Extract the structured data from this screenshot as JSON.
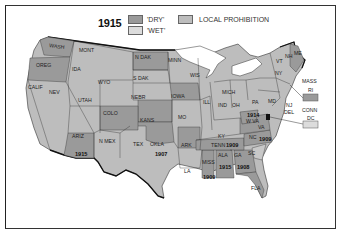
{
  "title": "1915",
  "legend": {
    "dry": {
      "label": "'DRY'",
      "color": "#9a9a9a"
    },
    "wet": {
      "label": "'WET'",
      "color": "#dcdcdc"
    },
    "local": {
      "label": "LOCAL PROHIBITION",
      "color": "#bdbdbd"
    }
  },
  "states": {
    "wash": "WASH",
    "oreg": "OREG",
    "calif": "CALIF",
    "ida": "IDA",
    "nev": "NEV",
    "mont": "MONT",
    "wyo": "WYO",
    "utah": "UTAH",
    "ariz": "ARIZ",
    "colo": "COLO",
    "nmex": "N MEX",
    "ndak": "N DAK",
    "sdak": "S DAK",
    "nebr": "NEBR",
    "kans": "KANS",
    "okla": "OKLA",
    "tex": "TEX",
    "minn": "MINN",
    "iowa": "IOWA",
    "mo": "MO",
    "ark": "ARK",
    "la": "LA",
    "wis": "WIS",
    "ill": "ILL",
    "mich": "MICH",
    "ind": "IND",
    "oh": "OH",
    "ky": "KY",
    "tenn": "TENN",
    "miss": "MISS",
    "ala": "ALA",
    "ga": "GA",
    "fla": "FLA",
    "sc": "SC",
    "nc": "NC",
    "va": "VA",
    "wva": "W VA",
    "pa": "PA",
    "md": "MD",
    "del": "DEL",
    "nj": "NJ",
    "ny": "NY",
    "conn": "CONN",
    "ri": "RI",
    "mass": "MASS",
    "vt": "VT",
    "nh": "NH",
    "me": "ME",
    "dc": "DC"
  },
  "dry_years": {
    "ariz": "1915",
    "okla": "1907",
    "tenn": "1909",
    "miss": "1909",
    "ala": "1915",
    "ga": "1908",
    "nc": "1909",
    "wva": "1914"
  }
}
